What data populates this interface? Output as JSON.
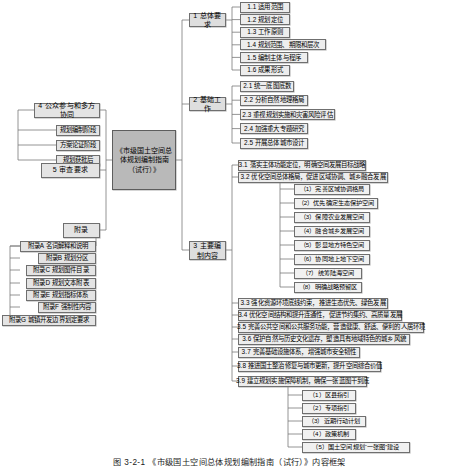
{
  "figure": {
    "caption": "图 3-2-1  《市级国土空间总体规划编制指南（试行）》内容框架",
    "center": "《市级国土空间总体规划编制指南（试行）》"
  },
  "branches": {
    "overall": {
      "label": "1 总体要求",
      "items": [
        "1.1 适用范围",
        "1.2 规划定位",
        "1.3 工作原则",
        "1.4 规划范围、期限和层次",
        "1.5 编制主体与程序",
        "1.6 成果形式"
      ]
    },
    "basic": {
      "label": "2 基础工作",
      "items": [
        "2.1 统一底图底数",
        "2.2 分析自然地理格局",
        "2.3 重视规划实施和灾害风险评估",
        "2.4 加强重大专题研究",
        "2.5 开展总体城市设计"
      ]
    },
    "main": {
      "label": "3 主要编制内容",
      "items": [
        "3.1 落实主体功能定位，明确空间发展目标战略",
        "3.2 优化空间总体格局，促进区域协调、城乡融合发展",
        "3.3 强化资源环境底线约束，推进生态优先、绿色发展",
        "3.4 优化空间结构和提升连通性，促进节约集约、高质量发展",
        "3.5 完善公共空间和公共服务功能，营造健康、舒适、便利的人居环境",
        "3.6 保护自然与历史文化遗存，塑造具有地域特色的城乡风貌",
        "3.7 完善基础设施体系，增强城市安全韧性",
        "3.8 推进国土整治修复与城市更新，提升空间综合价值",
        "3.9 建立规划实施保障机制，确保一张蓝图干到底"
      ],
      "sub_32": [
        "（1）完善区域协调格局",
        "（2）优先确定生态保护空间",
        "（3）保障农业发展空间",
        "（4）融合城乡发展空间",
        "（5）彰显地方特色空间",
        "（6）协同地上地下空间",
        "（7）统筹陆海空间",
        "（8）明确战略预留区"
      ],
      "sub_39": [
        "（1）区县指引",
        "（2）专项指引",
        "（3）近期行动计划",
        "（4）政策机制",
        "（5）国土空间规划“一张图”建设"
      ]
    },
    "public": {
      "label": "4 公众参与和多方协同",
      "items": [
        "规划编制阶段",
        "方案论证阶段",
        "规划获批后"
      ]
    },
    "review": {
      "label": "5 审查要求"
    },
    "appendix": {
      "label": "附录",
      "items": [
        "附录A 名词解释和说明",
        "附录B 规划分区",
        "附录C 规划图件目录",
        "附录D 规划文本附表",
        "附录E 规划指标体系",
        "附录F 强制性内容",
        "附录G 城镇开发边界划定要求"
      ]
    }
  }
}
